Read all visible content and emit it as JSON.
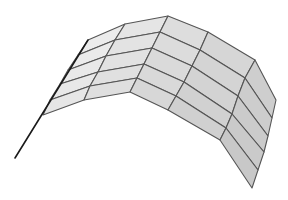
{
  "figure": {
    "type": "3d-surface-wireframe",
    "caption_fragment": "",
    "colors": {
      "background": "#ffffff",
      "fill_light": "#ececec",
      "fill_dark": "#c4c4c4",
      "mesh_line": "#555555",
      "edge_line": "#1a1a1a"
    },
    "mesh": {
      "rows": 6,
      "cols": 6,
      "vertices": [
        [
          [
            88,
            40
          ],
          [
            125,
            24
          ],
          [
            168,
            16
          ],
          [
            208,
            32
          ],
          [
            255,
            60
          ],
          [
            276,
            100
          ]
        ],
        [
          [
            78,
            55
          ],
          [
            115,
            40
          ],
          [
            160,
            32
          ],
          [
            200,
            50
          ],
          [
            245,
            78
          ],
          [
            272,
            118
          ]
        ],
        [
          [
            68,
            70
          ],
          [
            106,
            56
          ],
          [
            152,
            48
          ],
          [
            192,
            66
          ],
          [
            238,
            96
          ],
          [
            268,
            136
          ]
        ],
        [
          [
            60,
            84
          ],
          [
            98,
            72
          ],
          [
            144,
            64
          ],
          [
            184,
            82
          ],
          [
            232,
            114
          ],
          [
            264,
            152
          ]
        ],
        [
          [
            50,
            100
          ],
          [
            90,
            86
          ],
          [
            137,
            78
          ],
          [
            176,
            96
          ],
          [
            226,
            128
          ],
          [
            258,
            170
          ]
        ],
        [
          [
            43,
            115
          ],
          [
            84,
            100
          ],
          [
            130,
            92
          ],
          [
            168,
            110
          ],
          [
            220,
            140
          ],
          [
            252,
            188
          ]
        ]
      ]
    },
    "left_edge_line": [
      [
        88,
        40
      ],
      [
        15,
        158
      ]
    ]
  }
}
